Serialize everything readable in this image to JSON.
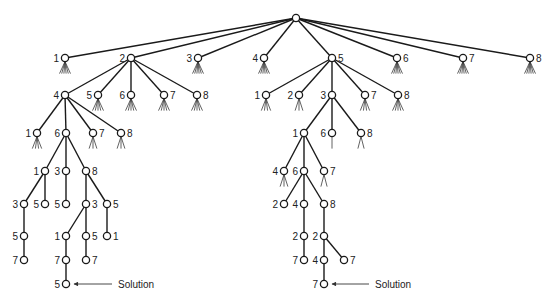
{
  "diagram": {
    "type": "search-tree",
    "colors": {
      "stroke": "#1a1a1a",
      "background": "#ffffff"
    },
    "nodes": [
      {
        "id": "root",
        "x": 296,
        "y": 18,
        "label": "",
        "side": "left",
        "fan": 0
      },
      {
        "id": "a1",
        "x": 65,
        "y": 58,
        "label": "1",
        "side": "left",
        "fan": 6,
        "parent": "root"
      },
      {
        "id": "a2",
        "x": 131,
        "y": 58,
        "label": "2",
        "side": "left",
        "fan": 0,
        "parent": "root"
      },
      {
        "id": "a3",
        "x": 198,
        "y": 58,
        "label": "3",
        "side": "left",
        "fan": 6,
        "parent": "root"
      },
      {
        "id": "a4",
        "x": 264,
        "y": 58,
        "label": "4",
        "side": "left",
        "fan": 6,
        "parent": "root"
      },
      {
        "id": "a5",
        "x": 332,
        "y": 58,
        "label": "5",
        "side": "right",
        "fan": 0,
        "parent": "root"
      },
      {
        "id": "a6",
        "x": 397,
        "y": 58,
        "label": "6",
        "side": "right",
        "fan": 6,
        "parent": "root"
      },
      {
        "id": "a7",
        "x": 463,
        "y": 58,
        "label": "7",
        "side": "right",
        "fan": 6,
        "parent": "root"
      },
      {
        "id": "a8",
        "x": 530,
        "y": 58,
        "label": "8",
        "side": "right",
        "fan": 6,
        "parent": "root"
      },
      {
        "id": "b4",
        "x": 65,
        "y": 95,
        "label": "4",
        "side": "left",
        "fan": 0,
        "parent": "a2"
      },
      {
        "id": "b5",
        "x": 98,
        "y": 95,
        "label": "5",
        "side": "left",
        "fan": 5,
        "parent": "a2"
      },
      {
        "id": "b6",
        "x": 131,
        "y": 95,
        "label": "6",
        "side": "left",
        "fan": 5,
        "parent": "a2"
      },
      {
        "id": "b7",
        "x": 164,
        "y": 95,
        "label": "7",
        "side": "right",
        "fan": 5,
        "parent": "a2"
      },
      {
        "id": "b8",
        "x": 197,
        "y": 95,
        "label": "8",
        "side": "right",
        "fan": 5,
        "parent": "a2"
      },
      {
        "id": "c1",
        "x": 37,
        "y": 133,
        "label": "1",
        "side": "left",
        "fan": 4,
        "parent": "b4"
      },
      {
        "id": "c6",
        "x": 66,
        "y": 133,
        "label": "6",
        "side": "left",
        "fan": 0,
        "parent": "b4"
      },
      {
        "id": "c7",
        "x": 93,
        "y": 133,
        "label": "7",
        "side": "right",
        "fan": 3,
        "parent": "b4"
      },
      {
        "id": "c8",
        "x": 121,
        "y": 133,
        "label": "8",
        "side": "right",
        "fan": 3,
        "parent": "b4"
      },
      {
        "id": "d1",
        "x": 45,
        "y": 171,
        "label": "1",
        "side": "left",
        "fan": 0,
        "parent": "c6"
      },
      {
        "id": "d3",
        "x": 66,
        "y": 171,
        "label": "3",
        "side": "left",
        "fan": 0,
        "parent": "c6"
      },
      {
        "id": "d8",
        "x": 86,
        "y": 171,
        "label": "8",
        "side": "right",
        "fan": 0,
        "parent": "c6"
      },
      {
        "id": "e3",
        "x": 24,
        "y": 204,
        "label": "3",
        "side": "left",
        "fan": 0,
        "parent": "d1"
      },
      {
        "id": "e5",
        "x": 45,
        "y": 204,
        "label": "5",
        "side": "left",
        "fan": 0,
        "parent": "d1"
      },
      {
        "id": "e5b",
        "x": 66,
        "y": 204,
        "label": "5",
        "side": "left",
        "fan": 0,
        "parent": "d3"
      },
      {
        "id": "e3b",
        "x": 86,
        "y": 204,
        "label": "3",
        "side": "right",
        "fan": 0,
        "parent": "d8"
      },
      {
        "id": "e5c",
        "x": 107,
        "y": 204,
        "label": "5",
        "side": "right",
        "fan": 0,
        "parent": "d8"
      },
      {
        "id": "f5",
        "x": 24,
        "y": 236,
        "label": "5",
        "side": "left",
        "fan": 0,
        "parent": "e3"
      },
      {
        "id": "f1",
        "x": 66,
        "y": 236,
        "label": "1",
        "side": "left",
        "fan": 0,
        "parent": "e3b"
      },
      {
        "id": "f5b",
        "x": 86,
        "y": 236,
        "label": "5",
        "side": "right",
        "fan": 0,
        "parent": "e3b"
      },
      {
        "id": "f1b",
        "x": 107,
        "y": 236,
        "label": "1",
        "side": "right",
        "fan": 0,
        "parent": "e5c"
      },
      {
        "id": "g7",
        "x": 24,
        "y": 260,
        "label": "7",
        "side": "left",
        "fan": 0,
        "parent": "f5"
      },
      {
        "id": "g7b",
        "x": 66,
        "y": 260,
        "label": "7",
        "side": "left",
        "fan": 0,
        "parent": "f1"
      },
      {
        "id": "g7c",
        "x": 86,
        "y": 260,
        "label": "7",
        "side": "right",
        "fan": 0,
        "parent": "f5b"
      },
      {
        "id": "h5",
        "x": 66,
        "y": 284,
        "label": "5",
        "side": "left",
        "fan": 0,
        "parent": "g7b"
      },
      {
        "id": "r1",
        "x": 266,
        "y": 95,
        "label": "1",
        "side": "left",
        "fan": 4,
        "parent": "a5"
      },
      {
        "id": "r2",
        "x": 299,
        "y": 95,
        "label": "2",
        "side": "left",
        "fan": 3,
        "parent": "a5"
      },
      {
        "id": "r3",
        "x": 332,
        "y": 95,
        "label": "3",
        "side": "left",
        "fan": 0,
        "parent": "a5"
      },
      {
        "id": "r7",
        "x": 365,
        "y": 95,
        "label": "7",
        "side": "right",
        "fan": 4,
        "parent": "a5"
      },
      {
        "id": "r8",
        "x": 398,
        "y": 95,
        "label": "8",
        "side": "right",
        "fan": 5,
        "parent": "a5"
      },
      {
        "id": "s1",
        "x": 304,
        "y": 133,
        "label": "1",
        "side": "left",
        "fan": 0,
        "parent": "r3"
      },
      {
        "id": "s6",
        "x": 332,
        "y": 133,
        "label": "6",
        "side": "left",
        "fan": 1,
        "parent": "r3"
      },
      {
        "id": "s8",
        "x": 361,
        "y": 133,
        "label": "8",
        "side": "right",
        "fan": 2,
        "parent": "r3"
      },
      {
        "id": "t4",
        "x": 284,
        "y": 171,
        "label": "4",
        "side": "left",
        "fan": 3,
        "parent": "s1"
      },
      {
        "id": "t6",
        "x": 304,
        "y": 171,
        "label": "6",
        "side": "left",
        "fan": 0,
        "parent": "s1"
      },
      {
        "id": "t7",
        "x": 324,
        "y": 171,
        "label": "7",
        "side": "right",
        "fan": 2,
        "parent": "s1"
      },
      {
        "id": "u2",
        "x": 284,
        "y": 204,
        "label": "2",
        "side": "left",
        "fan": 0,
        "parent": "t6"
      },
      {
        "id": "u4",
        "x": 304,
        "y": 204,
        "label": "4",
        "side": "left",
        "fan": 0,
        "parent": "t6"
      },
      {
        "id": "u8",
        "x": 324,
        "y": 204,
        "label": "8",
        "side": "right",
        "fan": 0,
        "parent": "t6"
      },
      {
        "id": "v2",
        "x": 304,
        "y": 236,
        "label": "2",
        "side": "left",
        "fan": 0,
        "parent": "u4"
      },
      {
        "id": "v2b",
        "x": 324,
        "y": 236,
        "label": "2",
        "side": "left",
        "fan": 0,
        "parent": "u8"
      },
      {
        "id": "w7",
        "x": 304,
        "y": 260,
        "label": "7",
        "side": "left",
        "fan": 0,
        "parent": "v2"
      },
      {
        "id": "w4",
        "x": 324,
        "y": 260,
        "label": "4",
        "side": "left",
        "fan": 0,
        "parent": "v2b"
      },
      {
        "id": "w7b",
        "x": 344,
        "y": 260,
        "label": "7",
        "side": "right",
        "fan": 0,
        "parent": "v2b"
      },
      {
        "id": "x7",
        "x": 324,
        "y": 284,
        "label": "7",
        "side": "left",
        "fan": 0,
        "parent": "w4"
      }
    ],
    "annotations": [
      {
        "text": "Solution",
        "x": 118,
        "y": 288,
        "arrow_from": [
          112,
          284
        ],
        "arrow_to": [
          74,
          284
        ]
      },
      {
        "text": "Solution",
        "x": 375,
        "y": 288,
        "arrow_from": [
          369,
          284
        ],
        "arrow_to": [
          332,
          284
        ]
      }
    ]
  }
}
